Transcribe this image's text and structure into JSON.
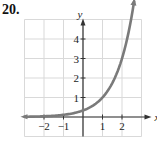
{
  "problem_number": "20.",
  "chart_data": {
    "type": "line",
    "title": "",
    "xlabel": "x",
    "ylabel": "y",
    "x_ticks": [
      "-2",
      "-1",
      "1",
      "2"
    ],
    "y_ticks": [
      "1",
      "2",
      "3",
      "4"
    ],
    "xlim": [
      -3,
      3
    ],
    "ylim": [
      -1,
      5
    ],
    "grid": true,
    "series": [
      {
        "name": "exponential curve",
        "color": "#7a7a7a",
        "x": [
          -3,
          -2,
          -1,
          0,
          0.5,
          1,
          1.5,
          2,
          2.5
        ],
        "y": [
          0.012,
          0.037,
          0.111,
          0.333,
          0.577,
          1.0,
          1.732,
          3.0,
          4.8
        ]
      }
    ]
  },
  "colors": {
    "grid": "#d9d9d9",
    "axis": "#333333",
    "curve": "#7a7a7a"
  }
}
